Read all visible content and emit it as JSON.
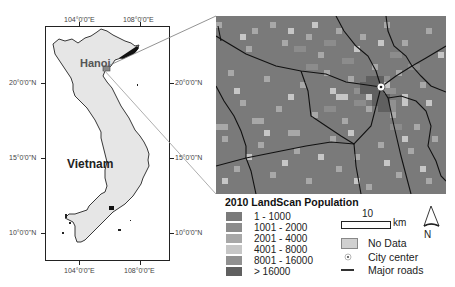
{
  "inset_map": {
    "country_label": "Vietnam",
    "city_label": "Hanoi",
    "lon_labels_top": [
      "104°0'0\"E",
      "108°0'0\"E"
    ],
    "lon_labels_bottom": [
      "104°0'0\"E",
      "108°0'0\"E"
    ],
    "lat_labels_left": [
      "20°0'0\"N",
      "15°0'0\"N",
      "10°0'0\"N"
    ],
    "lat_labels_right": [
      "20°0'0\"N",
      "15°0'0\"N",
      "10°0'0\"N"
    ],
    "land_color": "#e6e6e6",
    "outline_color": "#222222"
  },
  "detail_map": {
    "roads_color": "#111111",
    "city_center_icon": "city-center-icon"
  },
  "legend": {
    "title": "2010 LandScan Population",
    "classes": [
      {
        "label": "1 - 1000",
        "color": "#7a7a7a"
      },
      {
        "label": "1001 - 2000",
        "color": "#8c8c8c"
      },
      {
        "label": "2001 - 4000",
        "color": "#a8a8a8"
      },
      {
        "label": "4001 - 8000",
        "color": "#c6c6c6"
      },
      {
        "label": "8001 - 16000",
        "color": "#909090"
      },
      {
        "label": "> 16000",
        "color": "#606060"
      }
    ],
    "scale_value": "10",
    "scale_unit": "km",
    "no_data_label": "No Data",
    "city_center_label": "City center",
    "roads_label": "Major roads",
    "north_label": "N"
  }
}
